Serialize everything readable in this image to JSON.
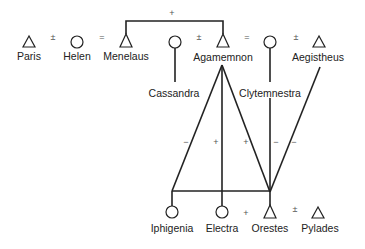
{
  "diagram": {
    "type": "kinship-relations",
    "people": [
      {
        "id": "paris",
        "name": "Paris",
        "sex": "male",
        "symbol": "triangle"
      },
      {
        "id": "helen",
        "name": "Helen",
        "sex": "female",
        "symbol": "circle"
      },
      {
        "id": "menelaus",
        "name": "Menelaus",
        "sex": "male",
        "symbol": "triangle"
      },
      {
        "id": "cassandra",
        "name": "Cassandra",
        "sex": "female",
        "symbol": "circle"
      },
      {
        "id": "agamemnon",
        "name": "Agamemnon",
        "sex": "male",
        "symbol": "triangle"
      },
      {
        "id": "clytemnestra",
        "name": "Clytemnestra",
        "sex": "female",
        "symbol": "circle"
      },
      {
        "id": "aegistheus",
        "name": "Aegistheus",
        "sex": "male",
        "symbol": "triangle"
      },
      {
        "id": "iphigenia",
        "name": "Iphigenia",
        "sex": "female",
        "symbol": "circle"
      },
      {
        "id": "electra",
        "name": "Electra",
        "sex": "female",
        "symbol": "circle"
      },
      {
        "id": "orestes",
        "name": "Orestes",
        "sex": "male",
        "symbol": "triangle"
      },
      {
        "id": "pylades",
        "name": "Pylades",
        "sex": "male",
        "symbol": "triangle"
      }
    ],
    "relations": [
      {
        "from": "paris",
        "to": "helen",
        "type": "marriage",
        "sign": "+"
      },
      {
        "from": "helen",
        "to": "menelaus",
        "type": "marriage",
        "sign": "−"
      },
      {
        "from": "menelaus",
        "to": "agamemnon",
        "type": "sibling",
        "sign": "+"
      },
      {
        "from": "cassandra",
        "to": "agamemnon",
        "type": "marriage",
        "sign": "+"
      },
      {
        "from": "agamemnon",
        "to": "clytemnestra",
        "type": "marriage",
        "sign": "−"
      },
      {
        "from": "clytemnestra",
        "to": "aegistheus",
        "type": "marriage",
        "sign": "+"
      },
      {
        "from": "agamemnon",
        "to": "iphigenia",
        "type": "descent",
        "sign": "−"
      },
      {
        "from": "agamemnon",
        "to": "electra",
        "type": "descent",
        "sign": "+"
      },
      {
        "from": "agamemnon",
        "to": "orestes",
        "type": "descent",
        "sign": "+"
      },
      {
        "from": "clytemnestra",
        "to": "orestes",
        "type": "descent",
        "sign": "−"
      },
      {
        "from": "aegistheus",
        "to": "orestes",
        "type": "opposition",
        "sign": "−"
      },
      {
        "from": "electra",
        "to": "orestes",
        "type": "sibling",
        "sign": "+"
      },
      {
        "from": "orestes",
        "to": "pylades",
        "type": "marriage",
        "sign": "+"
      }
    ]
  },
  "labels": {
    "paris": "Paris",
    "helen": "Helen",
    "menelaus": "Menelaus",
    "cassandra": "Cassandra",
    "agamemnon": "Agamemnon",
    "clytemnestra": "Clytemnestra",
    "aegistheus": "Aegistheus",
    "iphigenia": "Iphigenia",
    "electra": "Electra",
    "orestes": "Orestes",
    "pylades": "Pylades"
  },
  "signs": {
    "plus": "+",
    "minus": "−",
    "equals_plus": "±",
    "equals_minus": "="
  }
}
